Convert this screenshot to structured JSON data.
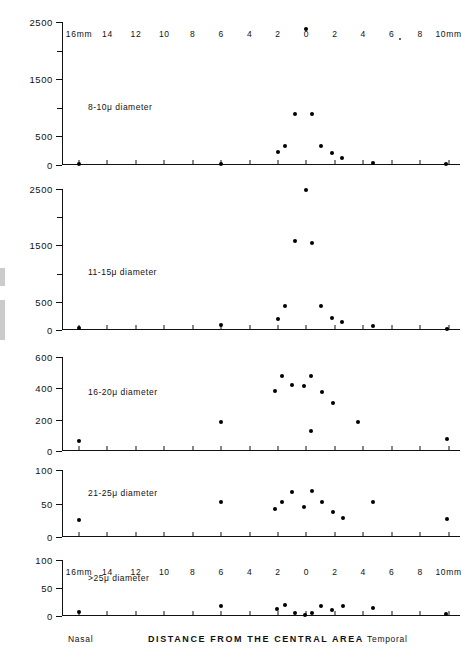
{
  "figure": {
    "axis_title": "DISTANCE FROM THE CENTRAL AREA",
    "left_side_label": "Nasal",
    "right_side_label": "Temporal"
  },
  "chart_data": {
    "type": "scatter",
    "title": "DISTANCE FROM THE CENTRAL AREA",
    "xlabel": "DISTANCE FROM THE CENTRAL AREA",
    "ylabel": "",
    "grid": false,
    "legend": "none",
    "x_axis": {
      "unit": "mm",
      "tick_labels": [
        "16mm",
        "14",
        "12",
        "10",
        "8",
        "6",
        "4",
        "2",
        "0",
        "2",
        "4",
        "6",
        "8",
        "10mm"
      ],
      "tick_values": [
        -16,
        -14,
        -12,
        -10,
        -8,
        -6,
        -4,
        -2,
        0,
        2,
        4,
        6,
        8,
        10
      ],
      "xlim": [
        -17.2,
        10.8
      ],
      "left_region": "Nasal",
      "right_region": "Temporal",
      "note": "Negative values are nasal, positive values are temporal"
    },
    "panels": [
      {
        "label": "8-10μ diameter",
        "ylim": [
          0,
          2500
        ],
        "yticks": [
          0,
          500,
          1500,
          2500
        ],
        "ytick_labels": [
          "0",
          "500",
          "1500",
          "2500"
        ],
        "yminor": [
          1000,
          2000
        ],
        "points": [
          {
            "x": -16.0,
            "y": 20
          },
          {
            "x": -6.0,
            "y": 25
          },
          {
            "x": -2.0,
            "y": 230
          },
          {
            "x": -1.5,
            "y": 330
          },
          {
            "x": -0.8,
            "y": 900
          },
          {
            "x": 0.0,
            "y": 2380
          },
          {
            "x": 0.4,
            "y": 890
          },
          {
            "x": 1.0,
            "y": 340
          },
          {
            "x": 1.8,
            "y": 215
          },
          {
            "x": 2.5,
            "y": 120
          },
          {
            "x": 4.7,
            "y": 35
          },
          {
            "x": 9.8,
            "y": 20
          }
        ]
      },
      {
        "label": "11-15μ diameter",
        "ylim": [
          0,
          2500
        ],
        "yticks": [
          0,
          500,
          1500,
          2500
        ],
        "ytick_labels": [
          "0",
          "500",
          "1500",
          "2500"
        ],
        "yminor": [
          1000,
          2000
        ],
        "points": [
          {
            "x": -16.0,
            "y": 30
          },
          {
            "x": -6.0,
            "y": 90
          },
          {
            "x": -2.0,
            "y": 200
          },
          {
            "x": -1.5,
            "y": 430
          },
          {
            "x": -0.8,
            "y": 1570
          },
          {
            "x": 0.0,
            "y": 2490
          },
          {
            "x": 0.4,
            "y": 1540
          },
          {
            "x": 1.0,
            "y": 430
          },
          {
            "x": 1.8,
            "y": 220
          },
          {
            "x": 2.5,
            "y": 150
          },
          {
            "x": 4.7,
            "y": 70
          },
          {
            "x": 9.9,
            "y": 25
          }
        ]
      },
      {
        "label": "16-20μ diameter",
        "ylim": [
          0,
          600
        ],
        "yticks": [
          0,
          200,
          400,
          600
        ],
        "ytick_labels": [
          "0",
          "200",
          "400",
          "600"
        ],
        "yminor": [],
        "points": [
          {
            "x": -16.0,
            "y": 65
          },
          {
            "x": -6.0,
            "y": 185
          },
          {
            "x": -2.2,
            "y": 385
          },
          {
            "x": -1.7,
            "y": 480
          },
          {
            "x": -1.0,
            "y": 420
          },
          {
            "x": -0.2,
            "y": 415
          },
          {
            "x": 0.3,
            "y": 480
          },
          {
            "x": 0.3,
            "y": 130
          },
          {
            "x": 1.1,
            "y": 375
          },
          {
            "x": 1.9,
            "y": 305
          },
          {
            "x": 3.6,
            "y": 185
          },
          {
            "x": 9.9,
            "y": 75
          }
        ]
      },
      {
        "label": "21-25μ diameter",
        "ylim": [
          0,
          100
        ],
        "yticks": [
          0,
          50,
          100
        ],
        "ytick_labels": [
          "0",
          "50",
          "100"
        ],
        "yminor": [],
        "points": [
          {
            "x": -16.0,
            "y": 25
          },
          {
            "x": -6.0,
            "y": 52
          },
          {
            "x": -2.2,
            "y": 42
          },
          {
            "x": -1.7,
            "y": 52
          },
          {
            "x": -1.0,
            "y": 67
          },
          {
            "x": -0.2,
            "y": 45
          },
          {
            "x": 0.4,
            "y": 68
          },
          {
            "x": 1.1,
            "y": 52
          },
          {
            "x": 1.9,
            "y": 38
          },
          {
            "x": 2.6,
            "y": 28
          },
          {
            "x": 4.7,
            "y": 52
          },
          {
            "x": 9.9,
            "y": 27
          }
        ]
      },
      {
        "label": ">25μ diameter",
        "ylim": [
          0,
          100
        ],
        "yticks": [
          0,
          50,
          100
        ],
        "ytick_labels": [
          "0",
          "50",
          "100"
        ],
        "yminor": [],
        "points": [
          {
            "x": -16.0,
            "y": 8
          },
          {
            "x": -6.0,
            "y": 17
          },
          {
            "x": -2.1,
            "y": 12
          },
          {
            "x": -1.5,
            "y": 20
          },
          {
            "x": -0.8,
            "y": 5
          },
          {
            "x": -0.1,
            "y": 1
          },
          {
            "x": 0.4,
            "y": 6
          },
          {
            "x": 1.0,
            "y": 17
          },
          {
            "x": 1.8,
            "y": 10
          },
          {
            "x": 2.6,
            "y": 18
          },
          {
            "x": 4.7,
            "y": 14
          },
          {
            "x": 9.8,
            "y": 4
          }
        ]
      }
    ]
  }
}
